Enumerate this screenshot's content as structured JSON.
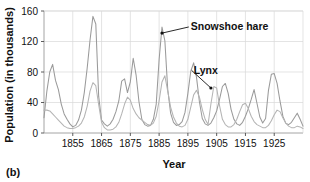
{
  "figure": {
    "panel_label": "(b)"
  },
  "chart_data": {
    "type": "line",
    "title": "",
    "xlabel": "Year",
    "ylabel": "Population (in thousands)",
    "xlim": [
      1845,
      1935
    ],
    "ylim": [
      0,
      160
    ],
    "xticks": [
      1855,
      1865,
      1875,
      1885,
      1895,
      1905,
      1915,
      1925
    ],
    "yticks": [
      0,
      40,
      80,
      120,
      160
    ],
    "xtick_labels": [
      "1855",
      "1865",
      "1875",
      "1885",
      "1895",
      "1905",
      "1915",
      "1925"
    ],
    "ytick_labels": [
      "0",
      "40",
      "80",
      "120",
      "160"
    ],
    "grid": "both",
    "legend": "annotations",
    "x": [
      1845,
      1846,
      1847,
      1848,
      1849,
      1850,
      1851,
      1852,
      1853,
      1854,
      1855,
      1856,
      1857,
      1858,
      1859,
      1860,
      1861,
      1862,
      1863,
      1864,
      1865,
      1866,
      1867,
      1868,
      1869,
      1870,
      1871,
      1872,
      1873,
      1874,
      1875,
      1876,
      1877,
      1878,
      1879,
      1880,
      1881,
      1882,
      1883,
      1884,
      1885,
      1886,
      1887,
      1888,
      1889,
      1890,
      1891,
      1892,
      1893,
      1894,
      1895,
      1896,
      1897,
      1898,
      1899,
      1900,
      1901,
      1902,
      1903,
      1904,
      1905,
      1906,
      1907,
      1908,
      1909,
      1910,
      1911,
      1912,
      1913,
      1914,
      1915,
      1916,
      1917,
      1918,
      1919,
      1920,
      1921,
      1922,
      1923,
      1924,
      1925,
      1926,
      1927,
      1928,
      1929,
      1930,
      1931,
      1932,
      1933,
      1934,
      1935
    ],
    "series": [
      {
        "name": "Snowshoe hare",
        "color": "#9a9a9a",
        "values": [
          20,
          55,
          80,
          90,
          69,
          57,
          38,
          25,
          18,
          12,
          8,
          10,
          17,
          30,
          53,
          85,
          122,
          153,
          143,
          48,
          17,
          12,
          9,
          12,
          18,
          28,
          42,
          68,
          71,
          53,
          67,
          98,
          76,
          41,
          18,
          11,
          9,
          10,
          18,
          38,
          96,
          139,
          121,
          57,
          26,
          14,
          10,
          11,
          15,
          27,
          52,
          81,
          92,
          73,
          41,
          19,
          12,
          10,
          13,
          20,
          29,
          44,
          61,
          65,
          52,
          31,
          18,
          12,
          10,
          14,
          22,
          32,
          44,
          57,
          39,
          21,
          13,
          19,
          56,
          77,
          78,
          65,
          42,
          22,
          13,
          11,
          14,
          20,
          26,
          18,
          9
        ]
      },
      {
        "name": "Lynx",
        "color": "#b4b4b4",
        "values": [
          30,
          30,
          29,
          25,
          21,
          17,
          13,
          9,
          7,
          6,
          6,
          7,
          9,
          13,
          21,
          35,
          55,
          66,
          62,
          37,
          14,
          7,
          4,
          4,
          5,
          8,
          14,
          25,
          38,
          47,
          43,
          32,
          25,
          20,
          17,
          14,
          11,
          10,
          13,
          22,
          42,
          67,
          75,
          55,
          34,
          21,
          13,
          9,
          8,
          10,
          18,
          34,
          50,
          56,
          47,
          31,
          18,
          11,
          38,
          61,
          59,
          36,
          18,
          11,
          8,
          8,
          11,
          18,
          28,
          37,
          39,
          32,
          22,
          15,
          11,
          9,
          7,
          7,
          10,
          16,
          24,
          30,
          28,
          20,
          13,
          9,
          7,
          7,
          9,
          8,
          6
        ]
      }
    ],
    "annotations": [
      {
        "text": "Snowshoe hare",
        "point_x": 1886,
        "point_y": 131,
        "label_x": 1896,
        "label_y": 143
      },
      {
        "text": "Lynx",
        "point_x": 1903,
        "point_y": 59,
        "label_x": 1897,
        "label_y": 86
      }
    ]
  }
}
